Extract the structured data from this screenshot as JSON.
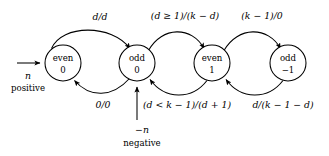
{
  "diagram": {
    "type": "state-transition-diagram",
    "colors": {
      "stroke": "#000000",
      "fill": "#ffffff",
      "background": "#ffffff"
    },
    "states": [
      {
        "id": "even0",
        "line1": "even",
        "line2": "0",
        "cx": 63,
        "cy": 63,
        "r": 18
      },
      {
        "id": "odd0",
        "line1": "odd",
        "line2": "0",
        "cx": 137,
        "cy": 63,
        "r": 18
      },
      {
        "id": "even1",
        "line1": "even",
        "line2": "1",
        "cx": 212,
        "cy": 63,
        "r": 18
      },
      {
        "id": "odd-1",
        "line1": "odd",
        "line2": "−1",
        "cx": 288,
        "cy": 63,
        "r": 18
      }
    ],
    "transitions": [
      {
        "id": "t1",
        "from": "even0",
        "to": "odd0",
        "label": "d/d",
        "label_x": 100,
        "label_y": 17,
        "direction": "top-rightward"
      },
      {
        "id": "t2",
        "from": "odd0",
        "to": "even1",
        "label": "(d ≥ 1)/(k − d)",
        "label_x": 185,
        "label_y": 16,
        "direction": "top-rightward"
      },
      {
        "id": "t3",
        "from": "even1",
        "to": "odd-1",
        "label": "(k − 1)/0",
        "label_x": 262,
        "label_y": 16,
        "direction": "top-rightward"
      },
      {
        "id": "t4",
        "from": "odd0",
        "to": "even0",
        "label": "0/0",
        "label_x": 103,
        "label_y": 105,
        "direction": "bottom-leftward"
      },
      {
        "id": "t5",
        "from": "even1",
        "to": "odd0",
        "label": "(d < k − 1)/(d + 1)",
        "label_x": 187,
        "label_y": 105,
        "direction": "bottom-leftward"
      },
      {
        "id": "t6",
        "from": "odd-1",
        "to": "even1",
        "label": "d/(k − 1 − d)",
        "label_x": 283,
        "label_y": 105,
        "direction": "bottom-leftward"
      }
    ],
    "entry_arrows": [
      {
        "id": "entry-positive",
        "target": "even0",
        "label_italic": "n",
        "label_plain": "positive",
        "label_x": 28,
        "label_italic_y": 76,
        "label_plain_y": 88,
        "orientation": "horizontal-left"
      },
      {
        "id": "entry-negative",
        "target": "odd0",
        "label_italic": "−n",
        "label_plain": "negative",
        "label_x": 142,
        "label_italic_y": 130,
        "label_plain_y": 143,
        "orientation": "vertical-bottom"
      }
    ]
  }
}
